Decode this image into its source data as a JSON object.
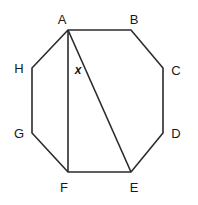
{
  "figure": {
    "type": "geometry-diagram",
    "shape_name": "octagon",
    "background_color": "#ffffff",
    "stroke_color": "#2b2b2b",
    "label_color": "#1a1a1a",
    "width": 198,
    "height": 205
  },
  "vertices": [
    {
      "label": "A",
      "x": 68,
      "y": 30,
      "label_x": 62,
      "label_y": 19
    },
    {
      "label": "B",
      "x": 131,
      "y": 30,
      "label_x": 134,
      "label_y": 19
    },
    {
      "label": "C",
      "x": 163,
      "y": 68,
      "label_x": 176,
      "label_y": 70
    },
    {
      "label": "D",
      "x": 163,
      "y": 133,
      "label_x": 176,
      "label_y": 133
    },
    {
      "label": "E",
      "x": 131,
      "y": 172,
      "label_x": 134,
      "label_y": 187
    },
    {
      "label": "F",
      "x": 68,
      "y": 172,
      "label_x": 64,
      "label_y": 187
    },
    {
      "label": "G",
      "x": 32,
      "y": 133,
      "label_x": 19,
      "label_y": 133
    },
    {
      "label": "H",
      "x": 32,
      "y": 68,
      "label_x": 19,
      "label_y": 68
    }
  ],
  "outline": {
    "points": "68,30 131,30 163,68 163,133 131,172 68,172 32,133 32,68"
  },
  "diagonals": [
    {
      "name": "segment-AF",
      "from": "A",
      "to": "F",
      "x1": 68,
      "y1": 30,
      "x2": 68,
      "y2": 172
    },
    {
      "name": "segment-AE",
      "from": "A",
      "to": "E",
      "x1": 68,
      "y1": 30,
      "x2": 131,
      "y2": 172
    }
  ],
  "angle_labels": [
    {
      "text": "x",
      "at_vertex": "A",
      "between": "AF and AE",
      "label_x": 78,
      "label_y": 70
    }
  ]
}
